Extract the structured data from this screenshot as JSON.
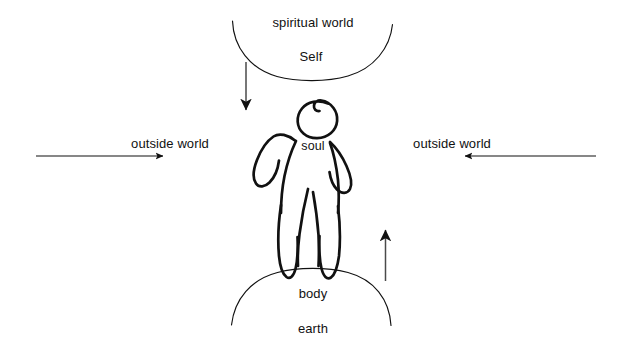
{
  "diagram": {
    "background_color": "#ffffff",
    "ink_color": "#111111",
    "labels": {
      "spiritual_world": "spiritual world",
      "self": "Self",
      "soul": "soul",
      "body": "body",
      "earth": "earth",
      "outside_world_left": "outside world",
      "outside_world_right": "outside world"
    },
    "arrows": [
      {
        "name": "arrow-down-from-spiritual-world",
        "direction": "down",
        "from": [
          246,
          62
        ],
        "to": [
          246,
          112
        ]
      },
      {
        "name": "arrow-right-outside-world-left",
        "direction": "right",
        "from": [
          36,
          156
        ],
        "to": [
          166,
          156
        ]
      },
      {
        "name": "arrow-left-outside-world-right",
        "direction": "left",
        "from": [
          596,
          156
        ],
        "to": [
          462,
          156
        ]
      },
      {
        "name": "arrow-up-from-earth",
        "direction": "up",
        "from": [
          385,
          281
        ],
        "to": [
          385,
          227
        ]
      }
    ],
    "shapes": [
      {
        "name": "spiritual-world-arc",
        "type": "arc",
        "opening": "down"
      },
      {
        "name": "earth-arc",
        "type": "arc",
        "opening": "up"
      },
      {
        "name": "human-figure",
        "type": "hand-drawn-figure"
      }
    ]
  }
}
